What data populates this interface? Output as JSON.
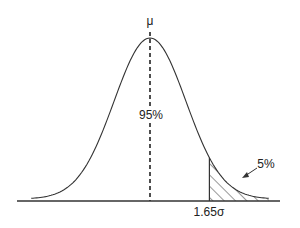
{
  "chart_data": {
    "type": "area",
    "title": "",
    "xlabel": "",
    "ylabel": "",
    "annotations": {
      "mean_label": "μ",
      "center_label": "95%",
      "tail_label": "5%",
      "critical_value_label": "1.65σ"
    },
    "mean": 0,
    "std": 1,
    "critical_value": 1.65,
    "tail_area_pct": 5,
    "center_area_pct": 95,
    "x_range_sigma": [
      -3.3,
      3.3
    ],
    "grid": false,
    "legend": null,
    "shaded_region": {
      "from_sigma": 1.65,
      "to_sigma": 3.3,
      "pattern": "diagonal-hatch"
    }
  },
  "colors": {
    "line": "#333333",
    "background": "#ffffff"
  }
}
